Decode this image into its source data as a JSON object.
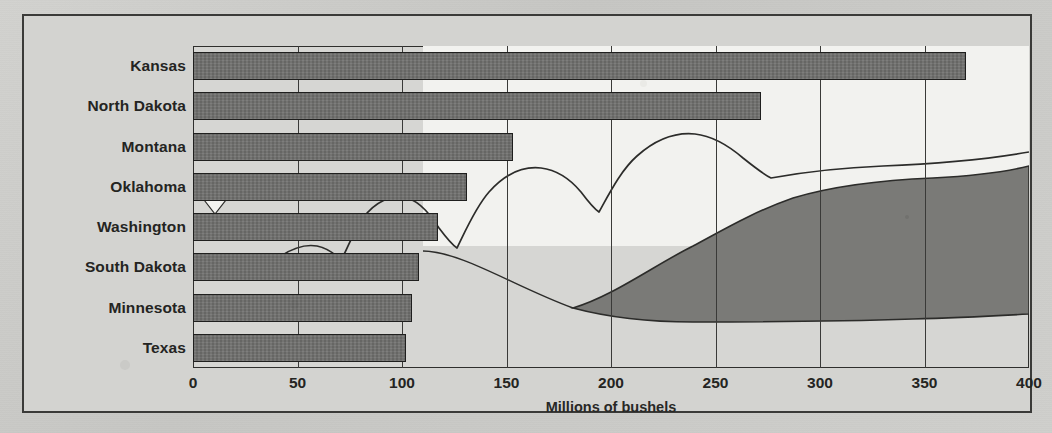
{
  "figure": {
    "axis_title": "Millions of bushels",
    "frame_color": "#3a3a38",
    "bar_color": "#6f6f6d",
    "plot_bg": "#d6d6d3",
    "page_bg": "#c9c9c6"
  },
  "chart_data": {
    "type": "bar",
    "orientation": "horizontal",
    "title": "",
    "xlabel": "Millions of bushels",
    "ylabel": "",
    "xlim": [
      0,
      400
    ],
    "grid": true,
    "legend": "none",
    "categories": [
      "Kansas",
      "North Dakota",
      "Montana",
      "Oklahoma",
      "Washington",
      "South Dakota",
      "Minnesota",
      "Texas"
    ],
    "values": [
      370,
      272,
      153,
      131,
      117,
      108,
      105,
      102
    ],
    "xticks": [
      0,
      50,
      100,
      150,
      200,
      250,
      300,
      350,
      400
    ],
    "xticklabels": [
      "0",
      "50",
      "100",
      "150",
      "200",
      "250",
      "300",
      "350",
      "400"
    ]
  },
  "overlay": {
    "name": "hills-artwork",
    "sky_color": "#f2f2ef",
    "hill_color": "#7a7a77",
    "line_color": "#2c2c2a"
  }
}
